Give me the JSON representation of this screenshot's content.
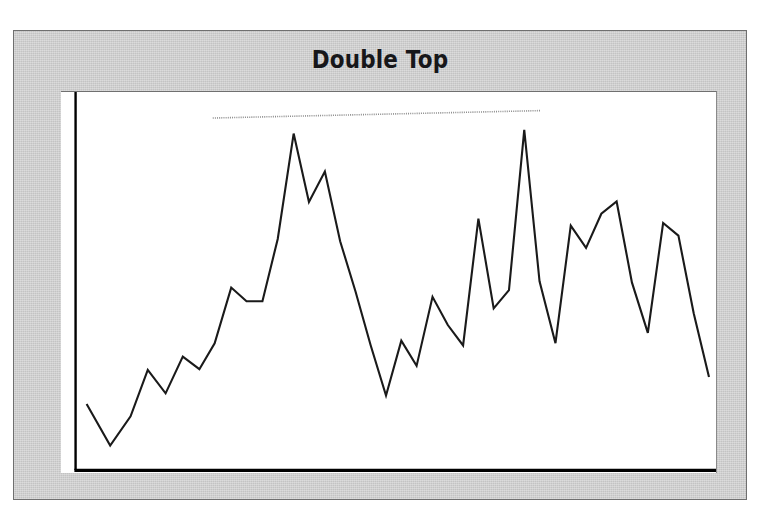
{
  "figure": {
    "title": "Double Top",
    "background_color": "#c9c9c9",
    "plot_background_color": "#ffffff",
    "frame_border_color": "#6f6f6f",
    "axis_color": "#000000",
    "series_color": "#1a1a1a",
    "resistance_line_color": "#8c8c8c"
  },
  "chart_data": {
    "type": "line",
    "title": "Double Top",
    "subtitle": "",
    "xlabel": "",
    "ylabel": "",
    "grid": false,
    "legend_position": "none",
    "xlim": [
      0,
      100
    ],
    "ylim": [
      0,
      100
    ],
    "axes": {
      "x_ticks": [],
      "y_ticks": [],
      "x_tick_labels": [],
      "y_tick_labels": []
    },
    "series": [
      {
        "name": "price",
        "color": "#1a1a1a",
        "x": [
          1.2,
          4.9,
          8.1,
          10.8,
          13.6,
          16.3,
          18.9,
          21.3,
          23.9,
          26.3,
          28.8,
          31.2,
          33.7,
          36.1,
          38.6,
          41.0,
          43.4,
          45.8,
          48.2,
          50.6,
          53.0,
          55.5,
          57.9,
          60.3,
          62.7,
          65.1,
          67.5,
          69.9,
          72.3,
          74.8,
          77.2,
          79.6,
          82.0,
          84.4,
          86.8,
          89.3,
          91.7,
          94.1,
          96.5,
          98.9
        ],
        "y": [
          17.5,
          6.3,
          14.2,
          26.7,
          20.4,
          30.3,
          26.9,
          33.9,
          48.9,
          45.2,
          45.2,
          62.0,
          90.4,
          72.0,
          80.2,
          61.4,
          47.9,
          33.3,
          19.8,
          34.6,
          27.8,
          46.4,
          38.8,
          33.3,
          67.5,
          43.3,
          48.2,
          91.4,
          50.6,
          33.9,
          65.6,
          59.6,
          68.8,
          72.1,
          50.3,
          36.7,
          66.3,
          62.9,
          42.0,
          24.8
        ]
      }
    ],
    "annotations": [
      {
        "type": "resistance-line",
        "label": "resistance",
        "style": "dotted",
        "color": "#8c8c8c",
        "x_start": 21.0,
        "x_end": 72.5,
        "y_start": 94.6,
        "y_end": 96.6
      },
      {
        "type": "peak-marker",
        "label": "first top",
        "x": 33.7,
        "y": 90.4
      },
      {
        "type": "peak-marker",
        "label": "second top",
        "x": 69.9,
        "y": 91.4
      }
    ],
    "pattern": "Double Top"
  }
}
